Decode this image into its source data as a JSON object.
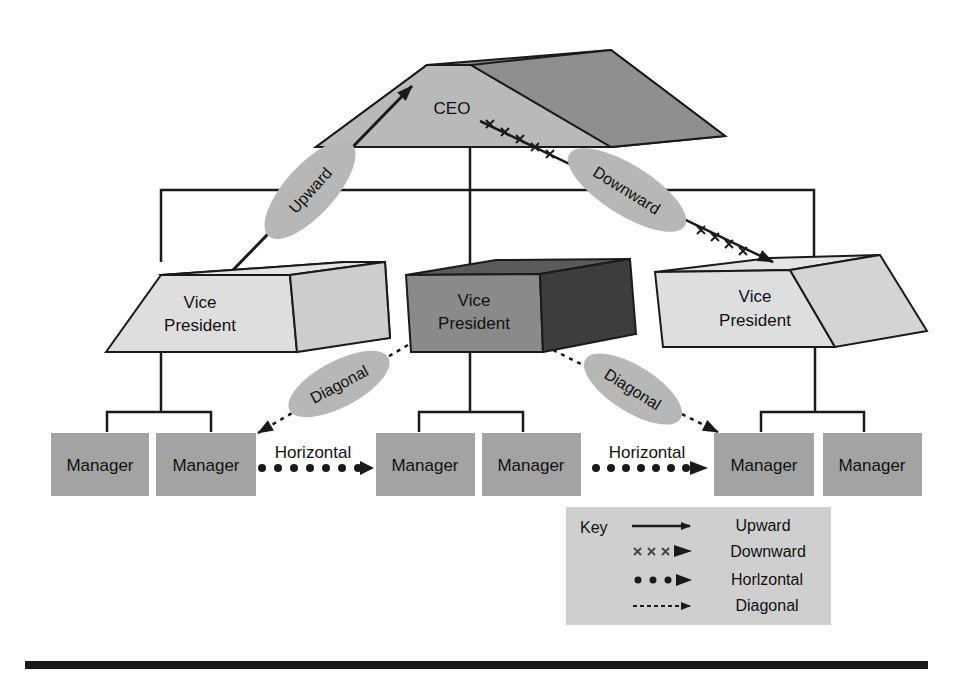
{
  "diagram": {
    "type": "org-communication-flow",
    "colors": {
      "ceo_front": "#b9b9b9",
      "ceo_side": "#8f8f8f",
      "vp_light_front": "#dedede",
      "vp_light_side": "#cdcdcd",
      "vp_dark_front": "#8a8a8a",
      "vp_dark_side": "#3d3d3d",
      "manager": "#a3a3a3",
      "label_bubble": "#b7b7b7",
      "key_bg": "#cfcfcf",
      "line": "#1a1a1a"
    },
    "nodes": {
      "ceo": "CEO",
      "vp_left": [
        "Vice",
        "President"
      ],
      "vp_center": [
        "Vice",
        "President"
      ],
      "vp_right": [
        "Vice",
        "President"
      ],
      "managers": [
        "Manager",
        "Manager",
        "Manager",
        "Manager",
        "Manager",
        "Manager"
      ]
    },
    "flows": {
      "upward": "Upward",
      "downward": "Downward",
      "diagonal_left": "Diagonal",
      "diagonal_right": "Diagonal",
      "horizontal_left": "Horizontal",
      "horizontal_right": "Horizontal"
    },
    "key": {
      "title": "Key",
      "items": [
        {
          "style": "solid",
          "label": "Upward"
        },
        {
          "style": "xxx",
          "label": "Downward"
        },
        {
          "style": "dots",
          "label": "Horlzontal"
        },
        {
          "style": "dashed",
          "label": "Diagonal"
        }
      ]
    }
  }
}
